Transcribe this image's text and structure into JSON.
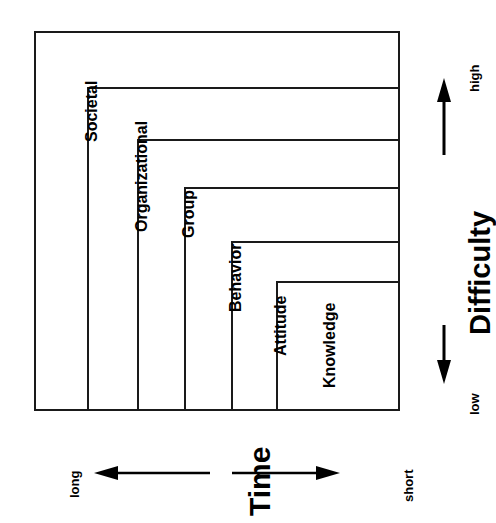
{
  "diagram": {
    "levels": [
      {
        "label": "Societal",
        "order": 1
      },
      {
        "label": "Organizational",
        "order": 2
      },
      {
        "label": "Group",
        "order": 3
      },
      {
        "label": "Behavior",
        "order": 4
      },
      {
        "label": "Attitude",
        "order": 5
      },
      {
        "label": "Knowledge",
        "order": 6
      }
    ],
    "vertical_axis": {
      "title": "Difficulty",
      "high_label": "high",
      "low_label": "low",
      "arrow": "double-headed",
      "high_end": "top",
      "low_end": "bottom"
    },
    "horizontal_axis": {
      "title": "Time",
      "left_label": "long",
      "right_label": "short",
      "arrow": "double-headed",
      "long_end": "left",
      "short_end": "right"
    },
    "colors": {
      "stroke": "#1a1a1a",
      "text": "#000000",
      "background": "#ffffff"
    }
  }
}
